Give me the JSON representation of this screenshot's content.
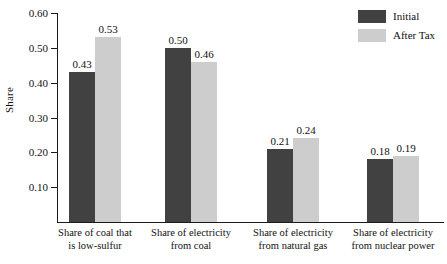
{
  "chart_data": {
    "type": "bar",
    "title": "",
    "xlabel": "",
    "ylabel": "Share",
    "ylim": [
      0.0,
      0.6
    ],
    "ytick_labels": [
      "0.60",
      "0.50",
      "0.40",
      "0.30",
      "0.20",
      "0.10"
    ],
    "ytick_values": [
      0.6,
      0.5,
      0.4,
      0.3,
      0.2,
      0.1
    ],
    "grid": false,
    "legend_position": "top-right",
    "categories": [
      "Share of coal that is low-sulfur",
      "Share of electricity from coal",
      "Share of electricity from natural gas",
      "Share of electricity from nuclear power"
    ],
    "category_lines": [
      {
        "line1": "Share of coal that",
        "line2": "is low-sulfur"
      },
      {
        "line1": "Share of electricity",
        "line2": "from coal"
      },
      {
        "line1": "Share of electricity",
        "line2": "from natural gas"
      },
      {
        "line1": "Share of electricity",
        "line2": "from nuclear power"
      }
    ],
    "series": [
      {
        "name": "Initial",
        "color": "#414141",
        "values": [
          0.43,
          0.5,
          0.21,
          0.18
        ],
        "labels": [
          "0.43",
          "0.50",
          "0.21",
          "0.18"
        ]
      },
      {
        "name": "After Tax",
        "color": "#cdcdcd",
        "values": [
          0.53,
          0.46,
          0.24,
          0.19
        ],
        "labels": [
          "0.53",
          "0.46",
          "0.24",
          "0.19"
        ]
      }
    ]
  },
  "legend": {
    "items": [
      {
        "label": "Initial",
        "color": "#414141"
      },
      {
        "label": "After Tax",
        "color": "#cdcdcd"
      }
    ]
  },
  "axes": {
    "y_title": "Share"
  }
}
